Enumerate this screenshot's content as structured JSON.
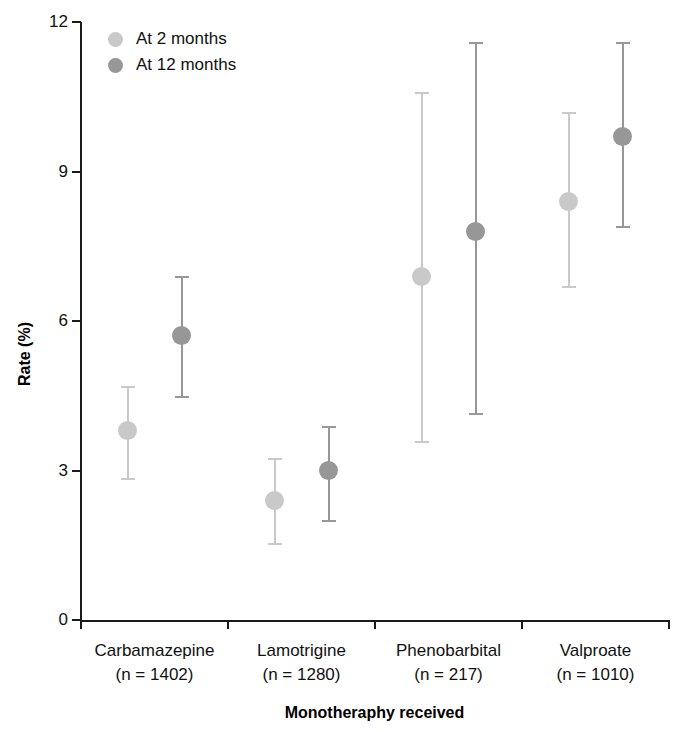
{
  "chart_data": {
    "type": "scatter",
    "title": "",
    "xlabel": "Monotheraphy received",
    "ylabel": "Rate (%)",
    "ylim": [
      0,
      12
    ],
    "yticks": [
      0,
      3,
      6,
      9,
      12
    ],
    "ytick_labels": [
      "0",
      "3",
      "6",
      "9",
      "12"
    ],
    "grid": false,
    "legend_position": "top-left",
    "error_bars": "95% confidence interval",
    "categories": [
      "Carbamazepine",
      "Lamotrigine",
      "Phenobarbital",
      "Valproate"
    ],
    "category_sublabels": [
      "(n = 1402)",
      "(n = 1280)",
      "(n = 217)",
      "(n = 1010)"
    ],
    "category_n": [
      1402,
      1280,
      217,
      1010
    ],
    "series": [
      {
        "name": "At 2 months",
        "color": "#c9c9c9",
        "values": [
          3.8,
          2.4,
          6.9,
          8.4
        ],
        "ci_low": [
          2.85,
          1.55,
          3.6,
          6.7
        ],
        "ci_high": [
          4.7,
          3.25,
          10.6,
          10.2
        ]
      },
      {
        "name": "At 12 months",
        "color": "#979797",
        "values": [
          5.7,
          3.0,
          7.8,
          9.7
        ],
        "ci_low": [
          4.5,
          2.0,
          4.15,
          7.9
        ],
        "ci_high": [
          6.9,
          3.9,
          11.6,
          11.6
        ]
      }
    ]
  },
  "axes": {
    "y_title": "Rate (%)",
    "x_title": "Monotheraphy received",
    "y_ticks": [
      {
        "label": "12",
        "value": 12
      },
      {
        "label": "9",
        "value": 9
      },
      {
        "label": "6",
        "value": 6
      },
      {
        "label": "3",
        "value": 3
      },
      {
        "label": "0",
        "value": 0
      }
    ]
  },
  "legend": {
    "items": [
      {
        "label": "At 2 months",
        "color": "#c9c9c9"
      },
      {
        "label": "At 12 months",
        "color": "#979797"
      }
    ]
  },
  "categories": [
    {
      "name": "Carbamazepine",
      "sublabel": "(n = 1402)"
    },
    {
      "name": "Lamotrigine",
      "sublabel": "(n = 1280)"
    },
    {
      "name": "Phenobarbital",
      "sublabel": "(n = 217)"
    },
    {
      "name": "Valproate",
      "sublabel": "(n = 1010)"
    }
  ]
}
